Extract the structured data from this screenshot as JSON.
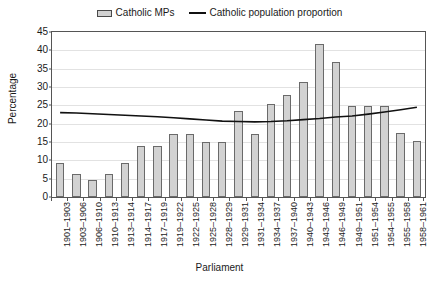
{
  "chart_data": {
    "type": "bar",
    "title": "",
    "xlabel": "Parliament",
    "ylabel": "Percentage",
    "ylim": [
      0,
      45
    ],
    "ytick_step": 5,
    "yticks": [
      0,
      5,
      10,
      15,
      20,
      25,
      30,
      35,
      40,
      45
    ],
    "grid": true,
    "legend_position": "top-center",
    "categories": [
      "1901–1903",
      "1903–1906",
      "1906–1910",
      "1910–1913",
      "1913–1914",
      "1914–1917",
      "1917–1919",
      "1919–1922",
      "1922–1925",
      "1925–1928",
      "1928–1929",
      "1929–1931",
      "1931–1934",
      "1934–1937",
      "1937–1940",
      "1940–1943",
      "1943–1946",
      "1946–1949",
      "1949–1951",
      "1951–1954",
      "1954–1955",
      "1955–1958",
      "1958–1961"
    ],
    "series": [
      {
        "name": "Catholic MPs",
        "render": "bar",
        "color": "#d2d2d2",
        "edge_color": "#6a6a6a",
        "values": [
          9.3,
          6.3,
          4.6,
          6.3,
          9.3,
          14.0,
          14.0,
          17.2,
          17.2,
          15.0,
          15.0,
          23.5,
          17.2,
          25.5,
          27.8,
          31.5,
          41.8,
          36.8,
          24.7,
          24.7,
          24.7,
          17.4,
          15.3
        ]
      },
      {
        "name": "Catholic population proportion",
        "render": "line",
        "color": "#111111",
        "values": [
          23.0,
          22.9,
          22.7,
          22.5,
          22.3,
          22.1,
          21.9,
          21.6,
          21.3,
          21.0,
          20.7,
          20.6,
          20.5,
          20.6,
          20.8,
          21.1,
          21.4,
          21.8,
          22.1,
          22.6,
          23.2,
          23.8,
          24.5
        ]
      }
    ]
  },
  "legend": {
    "entries": [
      {
        "label": "Catholic MPs",
        "marker": "bar-swatch"
      },
      {
        "label": "Catholic population proportion",
        "marker": "line-swatch"
      }
    ]
  }
}
